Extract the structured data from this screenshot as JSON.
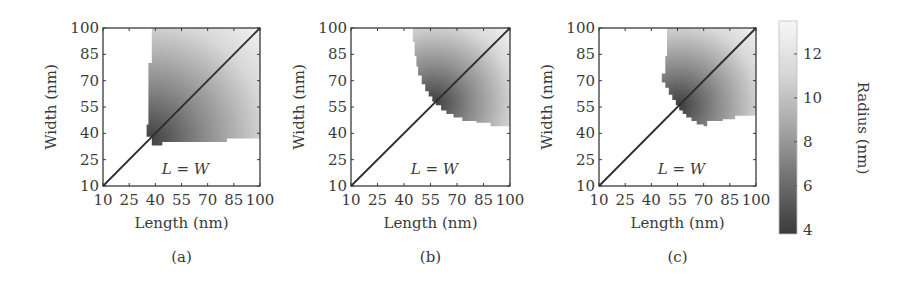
{
  "chart_data": [
    {
      "type": "heatmap",
      "panel_label": "(a)",
      "xlabel": "Length (nm)",
      "ylabel": "Width (nm)",
      "xlim": [
        10,
        100
      ],
      "ylim": [
        10,
        100
      ],
      "xticks": [
        "10",
        "25",
        "40",
        "55",
        "70",
        "85",
        "100"
      ],
      "yticks": [
        "10",
        "25",
        "40",
        "55",
        "70",
        "85",
        "100"
      ],
      "annotation": "L = W",
      "diagonal_line": {
        "from": [
          10,
          10
        ],
        "to": [
          100,
          100
        ]
      },
      "region_boundary": [
        [
          38,
          100
        ],
        [
          38,
          80
        ],
        [
          36,
          80
        ],
        [
          36,
          45
        ],
        [
          35,
          45
        ],
        [
          35,
          38
        ],
        [
          38,
          38
        ],
        [
          38,
          33
        ],
        [
          44,
          33
        ],
        [
          44,
          35
        ],
        [
          81,
          35
        ],
        [
          81,
          37
        ],
        [
          100,
          37
        ],
        [
          100,
          100
        ]
      ],
      "color_gradient": {
        "dark_corner": [
          36,
          36
        ],
        "light_corner": [
          100,
          100
        ]
      }
    },
    {
      "type": "heatmap",
      "panel_label": "(b)",
      "xlabel": "Length (nm)",
      "ylabel": "Width (nm)",
      "xlim": [
        10,
        100
      ],
      "ylim": [
        10,
        100
      ],
      "xticks": [
        "10",
        "25",
        "40",
        "55",
        "70",
        "85",
        "100"
      ],
      "yticks": [
        "10",
        "25",
        "40",
        "55",
        "70",
        "85",
        "100"
      ],
      "annotation": "L = W",
      "diagonal_line": {
        "from": [
          10,
          10
        ],
        "to": [
          100,
          100
        ]
      },
      "region_boundary": [
        [
          45,
          100
        ],
        [
          45,
          92
        ],
        [
          46,
          92
        ],
        [
          46,
          84
        ],
        [
          47,
          84
        ],
        [
          47,
          78
        ],
        [
          48,
          78
        ],
        [
          48,
          73
        ],
        [
          50,
          73
        ],
        [
          50,
          68
        ],
        [
          52,
          68
        ],
        [
          52,
          64
        ],
        [
          54,
          64
        ],
        [
          54,
          61
        ],
        [
          56,
          61
        ],
        [
          56,
          58
        ],
        [
          58,
          58
        ],
        [
          58,
          56
        ],
        [
          61,
          56
        ],
        [
          61,
          53
        ],
        [
          64,
          53
        ],
        [
          64,
          51
        ],
        [
          68,
          51
        ],
        [
          68,
          49
        ],
        [
          73,
          49
        ],
        [
          73,
          47
        ],
        [
          81,
          47
        ],
        [
          81,
          46
        ],
        [
          89,
          46
        ],
        [
          89,
          44
        ],
        [
          100,
          44
        ],
        [
          100,
          100
        ]
      ],
      "color_gradient": {
        "dark_corner": [
          57,
          57
        ],
        "light_corner": [
          100,
          100
        ]
      }
    },
    {
      "type": "heatmap",
      "panel_label": "(c)",
      "xlabel": "Length (nm)",
      "ylabel": "Width (nm)",
      "xlim": [
        10,
        100
      ],
      "ylim": [
        10,
        100
      ],
      "xticks": [
        "10",
        "25",
        "40",
        "55",
        "70",
        "85",
        "100"
      ],
      "yticks": [
        "10",
        "25",
        "40",
        "55",
        "70",
        "85",
        "100"
      ],
      "annotation": "L = W",
      "diagonal_line": {
        "from": [
          10,
          10
        ],
        "to": [
          100,
          100
        ]
      },
      "region_boundary": [
        [
          49,
          100
        ],
        [
          49,
          84
        ],
        [
          48,
          84
        ],
        [
          48,
          74
        ],
        [
          46,
          74
        ],
        [
          46,
          69
        ],
        [
          48,
          69
        ],
        [
          48,
          66
        ],
        [
          50,
          66
        ],
        [
          50,
          62
        ],
        [
          52,
          62
        ],
        [
          52,
          59
        ],
        [
          54,
          59
        ],
        [
          54,
          56
        ],
        [
          56,
          56
        ],
        [
          56,
          53
        ],
        [
          58,
          53
        ],
        [
          58,
          51
        ],
        [
          60,
          51
        ],
        [
          60,
          49
        ],
        [
          63,
          49
        ],
        [
          63,
          47
        ],
        [
          66,
          47
        ],
        [
          66,
          45
        ],
        [
          70,
          45
        ],
        [
          70,
          44
        ],
        [
          72,
          44
        ],
        [
          72,
          47
        ],
        [
          81,
          47
        ],
        [
          81,
          48
        ],
        [
          88,
          48
        ],
        [
          88,
          50
        ],
        [
          100,
          50
        ],
        [
          100,
          100
        ]
      ],
      "color_gradient": {
        "dark_corner": [
          56,
          56
        ],
        "light_corner": [
          100,
          100
        ]
      }
    }
  ],
  "colorbar": {
    "label": "Radius (nm)",
    "ticks": [
      "4",
      "6",
      "8",
      "10",
      "12"
    ],
    "range": [
      3.8,
      13.5
    ],
    "dark_color": "#3a3a3a",
    "light_color": "#f7f7f7"
  }
}
